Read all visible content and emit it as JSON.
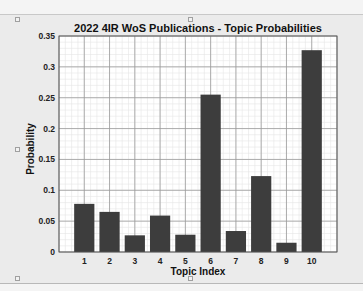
{
  "chart_data": {
    "type": "bar",
    "title": "2022 4IR WoS Publications - Topic Probabilities",
    "xlabel": "Topic Index",
    "ylabel": "Probability",
    "categories": [
      "1",
      "2",
      "3",
      "4",
      "5",
      "6",
      "7",
      "8",
      "9",
      "10"
    ],
    "values": [
      0.078,
      0.065,
      0.027,
      0.059,
      0.028,
      0.255,
      0.034,
      0.123,
      0.015,
      0.327
    ],
    "ylim": [
      0,
      0.35
    ],
    "xlim": [
      0,
      11
    ],
    "yticks": [
      "0",
      "0.05",
      "0.1",
      "0.15",
      "0.2",
      "0.25",
      "0.3",
      "0.35"
    ],
    "grid": true,
    "minor_grid": true,
    "bar_color": "#3d3d3d",
    "legend": null
  }
}
